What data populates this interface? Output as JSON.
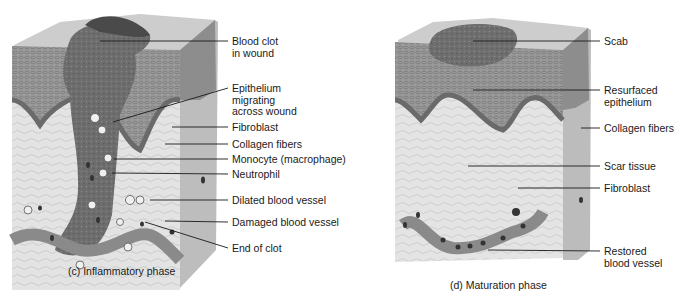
{
  "figure": {
    "panels": [
      {
        "id": "c",
        "caption": "(c) Inflammatory phase",
        "labels": [
          {
            "line1": "Blood clot",
            "line2": "in wound"
          },
          {
            "line1": "Epithelium",
            "line2": "migrating",
            "line3": "across wound"
          },
          {
            "line1": "Fibroblast"
          },
          {
            "line1": "Collagen fibers"
          },
          {
            "line1": "Monocyte (macrophage)"
          },
          {
            "line1": "Neutrophil"
          },
          {
            "line1": "Dilated blood vessel"
          },
          {
            "line1": "Damaged blood vessel"
          },
          {
            "line1": "End of clot"
          }
        ]
      },
      {
        "id": "d",
        "caption": "(d) Maturation phase",
        "labels": [
          {
            "line1": "Scab"
          },
          {
            "line1": "Resurfaced",
            "line2": "epithelium"
          },
          {
            "line1": "Collagen fibers"
          },
          {
            "line1": "Scar tissue"
          },
          {
            "line1": "Fibroblast"
          },
          {
            "line1": "Restored",
            "line2": "blood vessel"
          }
        ]
      }
    ]
  },
  "colors": {
    "epidermis_top": "#c9c9c9",
    "epidermis": "#8f8f8f",
    "basal_layer": "#6e6e6e",
    "dermis": "#e2e2e2",
    "clot": "#6a6a6a",
    "vessel": "#8a8a8a",
    "leader": "#1a1a1a"
  }
}
